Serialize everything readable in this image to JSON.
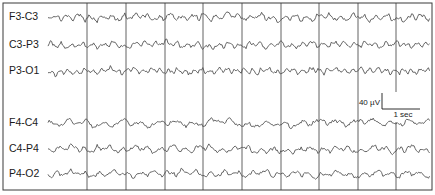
{
  "figure": {
    "frame": {
      "x": 3,
      "y": 3,
      "width": 429,
      "height": 187
    },
    "colors": {
      "trace": "#555555",
      "grid": "#3a3a3a",
      "text": "#1a1a1a",
      "background": "#ffffff"
    },
    "trace_x_start": 48,
    "trace_x_end": 430,
    "grid_lines_x": [
      87,
      126,
      165,
      203,
      242,
      281,
      319,
      358,
      396
    ],
    "grid_gap": {
      "x": 396,
      "y_from": 92,
      "y_to": 122
    },
    "channels": [
      {
        "label": "F3-C3",
        "y": 16,
        "amp": 4.2,
        "freq": 0.55,
        "seed": 11
      },
      {
        "label": "C3-P3",
        "y": 44,
        "amp": 3.6,
        "freq": 0.6,
        "seed": 23
      },
      {
        "label": "P3-O1",
        "y": 70,
        "amp": 3.4,
        "freq": 0.75,
        "seed": 37
      },
      {
        "label": "F4-C4",
        "y": 122,
        "amp": 3.8,
        "freq": 0.35,
        "seed": 41
      },
      {
        "label": "C4-P4",
        "y": 148,
        "amp": 3.8,
        "freq": 0.5,
        "seed": 53
      },
      {
        "label": "P4-O2",
        "y": 173,
        "amp": 3.6,
        "freq": 0.45,
        "seed": 67
      }
    ],
    "scale_bar": {
      "voltage_label": "40 µV",
      "time_label": "1 sec",
      "corner_x": 382,
      "corner_y": 109,
      "vertical_top_y": 93,
      "horizontal_end_x": 420
    }
  }
}
